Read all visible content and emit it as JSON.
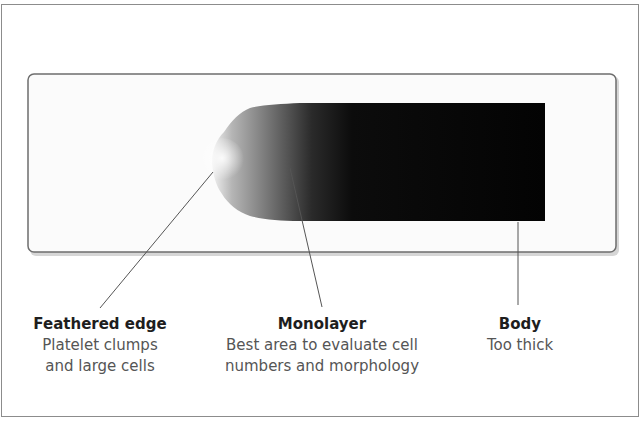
{
  "diagram": {
    "colors": {
      "frame_border": "#8c8c8c",
      "slide_border": "#6e6e6e",
      "slide_fill": "#fbfbfb",
      "smear_dark": "#050505",
      "smear_light": "#e8e8e8",
      "pointer_line": "#555555"
    },
    "labels": [
      {
        "id": "feathered-edge",
        "title": "Feathered edge",
        "description_lines": [
          "Platelet clumps",
          "and large cells"
        ]
      },
      {
        "id": "monolayer",
        "title": "Monolayer",
        "description_lines": [
          "Best area to evaluate cell",
          "numbers and morphology"
        ]
      },
      {
        "id": "body",
        "title": "Body",
        "description_lines": [
          "Too thick"
        ]
      }
    ]
  }
}
